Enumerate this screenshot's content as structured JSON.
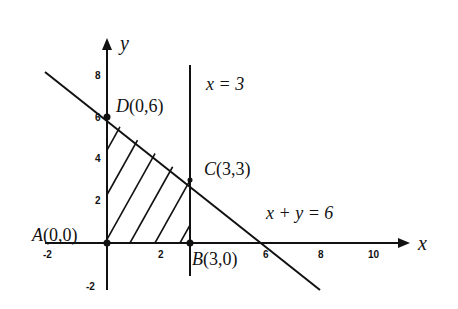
{
  "figure": {
    "type": "linear-programming-feasible-region",
    "axes": {
      "x_label": "x",
      "y_label": "y",
      "x_ticks": [
        "-2",
        "2",
        "6",
        "8",
        "10"
      ],
      "y_ticks": [
        "8",
        "6",
        "4",
        "2",
        "-2"
      ]
    },
    "lines": [
      {
        "equation": "x = 3",
        "label": "x = 3"
      },
      {
        "equation": "x + y = 6",
        "label": "x + y = 6"
      }
    ],
    "points": [
      {
        "name": "A",
        "coords": "(0,0)",
        "label": "A(0,0)"
      },
      {
        "name": "B",
        "coords": "(3,0)",
        "label": "B(3,0)"
      },
      {
        "name": "C",
        "coords": "(3,3)",
        "label": "C(3,3)"
      },
      {
        "name": "D",
        "coords": "(0,6)",
        "label": "D(0,6)"
      }
    ],
    "shaded_region": "ABCD (hatched)",
    "colors": {
      "ink": "#111111",
      "background": "#ffffff"
    }
  }
}
